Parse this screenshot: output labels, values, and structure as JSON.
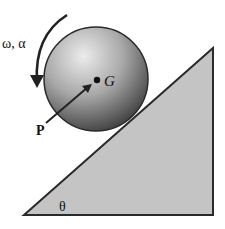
{
  "diagram": {
    "type": "physics-free-body",
    "labels": {
      "angular": "ω, α",
      "center": "G",
      "force": "P",
      "angle": "θ"
    },
    "colors": {
      "incline_fill": "#c4c4c4",
      "outline": "#2a2a2a",
      "sphere_light": "#e6e6e6",
      "sphere_dark": "#2e2e2e",
      "background": "#ffffff"
    }
  }
}
